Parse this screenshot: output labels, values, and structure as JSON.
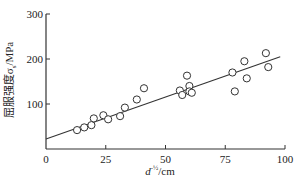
{
  "chart_data": {
    "type": "scatter",
    "title": "",
    "xlabel": "d^-1/2/cm",
    "ylabel": "屈服强度σs/MPa",
    "xlim": [
      0,
      100
    ],
    "ylim": [
      0,
      300
    ],
    "xticks": [
      0,
      25,
      50,
      75,
      100
    ],
    "yticks": [
      100,
      200,
      300
    ],
    "grid": false,
    "legend": null,
    "series": [
      {
        "name": "measured",
        "marker": "open-circle",
        "x": [
          13,
          16,
          19,
          20,
          24,
          26,
          31,
          33,
          38,
          41,
          56,
          57,
          59,
          60,
          60,
          61,
          78,
          79,
          83,
          84,
          92,
          93
        ],
        "y": [
          42,
          48,
          53,
          68,
          75,
          66,
          73,
          92,
          110,
          135,
          130,
          120,
          163,
          140,
          128,
          125,
          170,
          128,
          195,
          157,
          213,
          182
        ]
      },
      {
        "name": "fit",
        "type": "line",
        "x": [
          0,
          98
        ],
        "y": [
          22,
          205
        ]
      }
    ]
  },
  "labels": {
    "x_axis": "d",
    "x_axis_sup": "-½",
    "x_axis_unit": "/cm",
    "y_axis": "屈服强度σ",
    "y_axis_sub": "s",
    "y_axis_unit": "/MPa"
  },
  "ticks": {
    "x": [
      "0",
      "25",
      "50",
      "75",
      "100"
    ],
    "y": [
      "100",
      "200",
      "300"
    ]
  }
}
